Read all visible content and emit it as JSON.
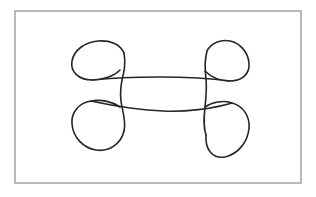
{
  "figure": {
    "kind": "line-drawing",
    "background_color": "#ffffff",
    "frame": {
      "name": "border-rectangle",
      "x": 15,
      "y": 11,
      "width": 286,
      "height": 172,
      "stroke_color": "#8c8c8c",
      "stroke_width": 1.2,
      "fill_color": "#ffffff"
    },
    "ink": {
      "stroke_color": "#262626",
      "stroke_width": 1.6
    },
    "strokes": [
      {
        "name": "top-left-loop",
        "d": "M 124 53 C 120 44 110 40 98 41 C 85 42 74 50 72 61 C 70 72 79 80 92 80 C 103 80 114 76 120 70"
      },
      {
        "name": "left-vertical-stroke",
        "d": "M 124 53 C 126 64 124 72 122 80 C 120 90 120 98 122 107 C 124 116 126 123 124 131"
      },
      {
        "name": "bottom-left-loop",
        "d": "M 120 107 C 113 102 102 99 91 101 C 79 103 71 112 72 124 C 73 137 83 148 96 150 C 109 152 121 144 124 131"
      },
      {
        "name": "top-right-loop",
        "d": "M 207 51 C 211 43 221 39 230 41 C 240 43 248 52 249 63 C 250 74 242 81 230 81 C 220 81 211 77 205 71"
      },
      {
        "name": "right-vertical-stroke",
        "d": "M 207 51 C 204 62 205 71 206 79 C 207 89 206 98 205 107 C 204 117 203 126 206 135"
      },
      {
        "name": "bottom-right-loop",
        "d": "M 205 107 C 212 102 223 100 232 103 C 243 106 250 116 249 128 C 248 142 238 154 225 157 C 212 159 205 149 206 135"
      },
      {
        "name": "upper-horizontal-stroke",
        "d": "M 92 80 C 110 78 135 77 160 77 C 185 77 208 78 230 81"
      },
      {
        "name": "lower-horizontal-stroke",
        "d": "M 91 101 C 110 105 137 110 163 111 C 185 112 212 109 232 103"
      }
    ]
  }
}
